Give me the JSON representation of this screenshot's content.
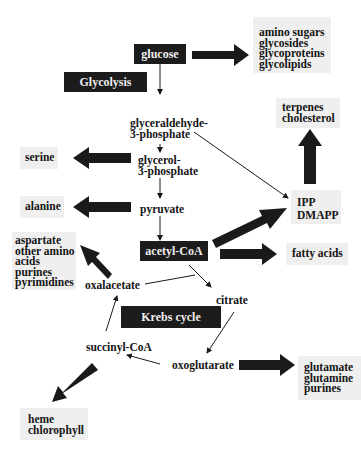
{
  "diagram": {
    "dark_nodes": {
      "glucose": "glucose",
      "glycolysis": "Glycolysis",
      "acetyl_coa": "acetyl-CoA",
      "krebs_cycle": "Krebs cycle"
    },
    "intermediates": {
      "glyceraldehyde_3p": [
        "glyceraldehyde-",
        "3-phosphate"
      ],
      "glycerol_3p": [
        "glycerol-",
        "3-phosphate"
      ],
      "pyruvate": "pyruvate",
      "oxalacetate": "oxalacetate",
      "citrate": "citrate",
      "succinyl_coa": "succinyl-CoA",
      "oxoglutarate": "oxoglutarate"
    },
    "products": {
      "sugars": [
        "amino sugars",
        "glycosides",
        "glycoproteins",
        "glycolipids"
      ],
      "terpenes": [
        "terpenes",
        "cholesterol"
      ],
      "ipp": [
        "IPP",
        "DMAPP"
      ],
      "serine": "serine",
      "alanine": "alanine",
      "aspartate": [
        "aspartate",
        "other amino",
        "acids",
        "purines",
        "pyrimidines"
      ],
      "fatty_acids": "fatty acids",
      "glutamate": [
        "glutamate",
        "glutamine",
        "purines"
      ],
      "heme": [
        "heme",
        "chlorophyll"
      ]
    },
    "colors": {
      "dark_box": "#1c1c1c",
      "product_box": "#efefef",
      "arrow": "#1a1a1a"
    }
  }
}
